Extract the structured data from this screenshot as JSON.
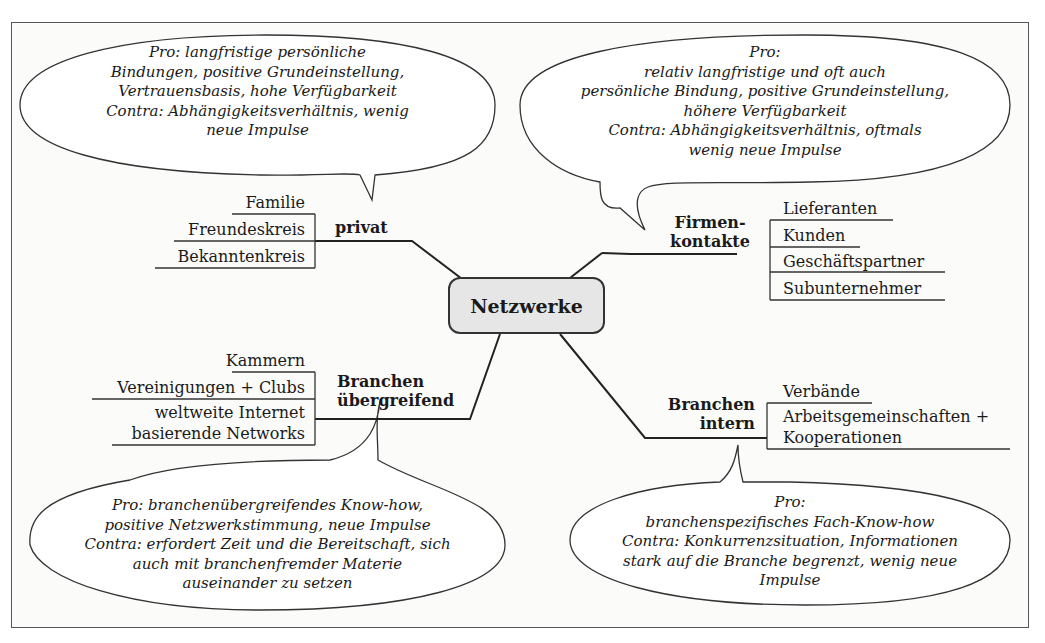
{
  "diagram": {
    "title": "Netzwerke",
    "branches": {
      "privat": {
        "label": "privat",
        "items": [
          "Familie",
          "Freundeskreis",
          "Bekanntenkreis"
        ],
        "bubble": [
          "Pro: langfristige persönliche",
          "Bindungen, positive Grundeinstellung,",
          "Vertrauensbasis, hohe Verfügbarkeit",
          "Contra: Abhängigkeitsverhältnis, wenig",
          "neue Impulse"
        ]
      },
      "firmenkontakte": {
        "label_line1": "Firmen-",
        "label_line2": "kontakte",
        "items": [
          "Lieferanten",
          "Kunden",
          "Geschäftspartner",
          "Subunternehmer"
        ],
        "bubble": [
          "Pro:",
          "relativ langfristige und oft auch",
          "persönliche Bindung, positive Grundeinstellung,",
          "höhere Verfügbarkeit",
          "Contra: Abhängigkeitsverhältnis, oftmals",
          "wenig neue Impulse"
        ]
      },
      "uebergreifend": {
        "label_line1": "Branchen",
        "label_line2": "übergreifend",
        "items": [
          "Kammern",
          "Vereinigungen + Clubs",
          "weltweite Internet",
          "basierende Networks"
        ],
        "bubble": [
          "Pro: branchenübergreifendes Know-how,",
          "positive Netzwerkstimmung, neue Impulse",
          "Contra: erfordert Zeit und die Bereitschaft, sich",
          "auch mit branchenfremder Materie",
          "auseinander zu setzen"
        ]
      },
      "intern": {
        "label_line1": "Branchen",
        "label_line2": "intern",
        "items": [
          "Verbände",
          "Arbeitsgemeinschaften +",
          "Kooperationen"
        ],
        "bubble": [
          "Pro:",
          "branchenspezifisches Fach-Know-how",
          "Contra: Konkurrenzsituation, Informationen",
          "stark auf die Branche begrenzt, wenig neue",
          "Impulse"
        ]
      }
    },
    "colors": {
      "line": "#222222",
      "center_fill": "#e6e6e6",
      "background": "#fbfbfa"
    }
  }
}
